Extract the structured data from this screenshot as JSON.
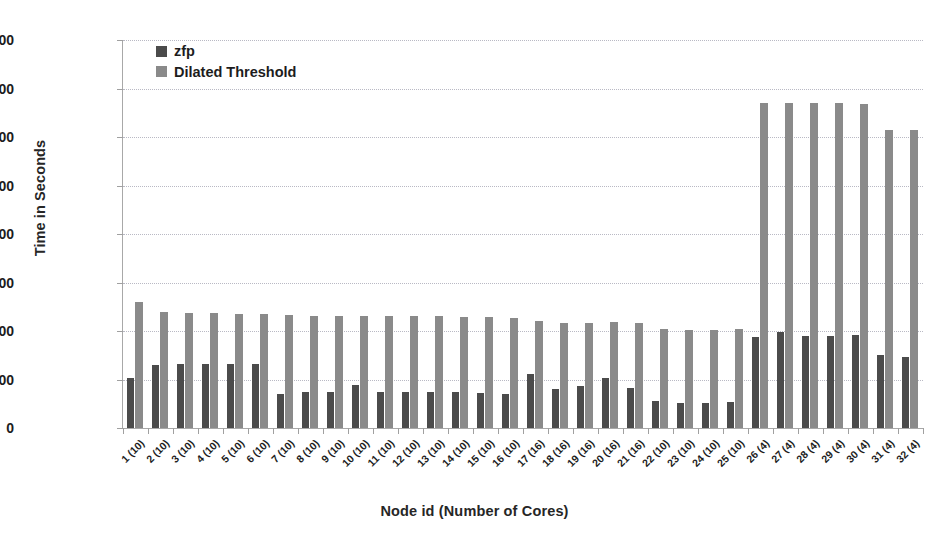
{
  "chart_data": {
    "type": "bar",
    "title": "",
    "xlabel": "Node id (Number of Cores)",
    "ylabel": "Time in Seconds",
    "ylim": [
      0,
      1600
    ],
    "ytick_step": 200,
    "yticks": [
      0,
      200,
      400,
      600,
      800,
      1000,
      1200,
      1400,
      1600
    ],
    "grid": true,
    "legend_position": "top-left",
    "categories": [
      "1 (10)",
      "2 (10)",
      "3 (10)",
      "4 (10)",
      "5 (10)",
      "6 (10)",
      "7 (10)",
      "8 (10)",
      "9 (10)",
      "10 (10)",
      "11 (10)",
      "12 (10)",
      "13 (10)",
      "14 (10)",
      "15 (10)",
      "16 (10)",
      "17 (16)",
      "18 (16)",
      "19 (16)",
      "20 (16)",
      "21 (16)",
      "22 (10)",
      "23 (10)",
      "24 (10)",
      "25 (10)",
      "26 (4)",
      "27 (4)",
      "28 (4)",
      "29 (4)",
      "30 (4)",
      "31 (4)",
      "32 (4)"
    ],
    "series": [
      {
        "name": "zfp",
        "color": "#4b4b4b",
        "values": [
          205,
          258,
          262,
          262,
          262,
          262,
          140,
          150,
          150,
          178,
          148,
          148,
          148,
          148,
          146,
          140,
          223,
          160,
          175,
          205,
          167,
          110,
          103,
          103,
          108,
          375,
          395,
          380,
          380,
          382,
          300,
          293
        ]
      },
      {
        "name": "Dilated Threshold",
        "color": "#8a8a8a",
        "values": [
          520,
          478,
          476,
          474,
          472,
          472,
          465,
          463,
          463,
          463,
          461,
          460,
          460,
          458,
          458,
          455,
          440,
          433,
          432,
          437,
          432,
          407,
          405,
          404,
          407,
          1340,
          1340,
          1342,
          1340,
          1338,
          1230,
          1230
        ]
      }
    ]
  },
  "legend": {
    "items": [
      {
        "label": "zfp"
      },
      {
        "label": "Dilated Threshold"
      }
    ]
  }
}
